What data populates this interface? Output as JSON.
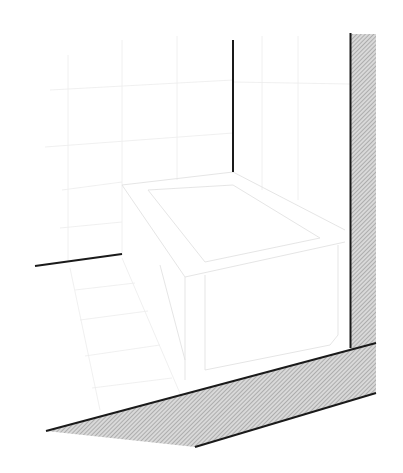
{
  "diagram": {
    "colors": {
      "background": "#ffffff",
      "section_line": "#1a1a1a",
      "hatch": "#9a9a9a",
      "faint_line": "#e6e6e6"
    },
    "elements": [
      {
        "name": "right-wall-section",
        "type": "hatched-rect"
      },
      {
        "name": "floor-slab-section",
        "type": "hatched-polygon"
      },
      {
        "name": "center-wall-edge-line",
        "type": "line"
      },
      {
        "name": "left-floor-edge-line",
        "type": "line"
      },
      {
        "name": "bathtub",
        "type": "faint-outline"
      },
      {
        "name": "wall-tiles",
        "type": "faint-grid"
      },
      {
        "name": "floor-tiles",
        "type": "faint-grid"
      }
    ]
  }
}
